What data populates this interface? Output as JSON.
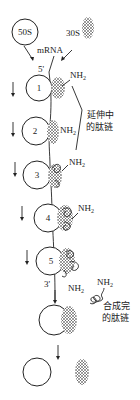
{
  "labels": {
    "large_subunit": "50S",
    "small_subunit": "30S",
    "mrna": "mRNA",
    "five_prime": "5'",
    "three_prime": "3'",
    "amino_end": "NH",
    "amino_sub": "2",
    "elongating_chain_line1": "延伸中",
    "elongating_chain_line2": "的肽链",
    "completed_chain_line1": "合成完",
    "completed_chain_line2": "的肽链"
  },
  "ribosomes": [
    {
      "number": "1"
    },
    {
      "number": "2"
    },
    {
      "number": "3"
    },
    {
      "number": "4"
    },
    {
      "number": "5"
    }
  ],
  "colors": {
    "ink": "#222222",
    "background": "#ffffff"
  }
}
